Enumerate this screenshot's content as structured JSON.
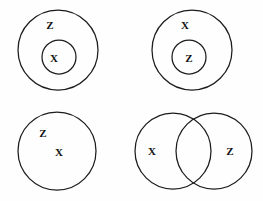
{
  "figure": {
    "title": "",
    "background_color": "#fefefe",
    "stroke_color": "#1c1c1c",
    "label_color": "#111111",
    "panels": [
      {
        "name": "top-left",
        "description": "X nested inside Z",
        "circles": [
          {
            "name": "outer-circle",
            "cx": 58,
            "cy": 50,
            "r": 40
          },
          {
            "name": "inner-circle",
            "cx": 59,
            "cy": 57,
            "r": 17
          }
        ],
        "labels": [
          {
            "name": "label-z-outer",
            "text": "Z",
            "x": 50,
            "y": 25
          },
          {
            "name": "label-x-inner",
            "text": "X",
            "x": 54,
            "y": 58
          }
        ]
      },
      {
        "name": "top-right",
        "description": "Z nested inside X",
        "circles": [
          {
            "name": "outer-circle",
            "cx": 192,
            "cy": 50,
            "r": 40
          },
          {
            "name": "inner-circle",
            "cx": 189,
            "cy": 57,
            "r": 17
          }
        ],
        "labels": [
          {
            "name": "label-x-outer",
            "text": "X",
            "x": 185,
            "y": 25
          },
          {
            "name": "label-z-inner",
            "text": "Z",
            "x": 189,
            "y": 58
          }
        ]
      },
      {
        "name": "bottom-left",
        "description": "X and Z in one circle",
        "circles": [
          {
            "name": "single-circle",
            "cx": 57,
            "cy": 151,
            "r": 39
          }
        ],
        "labels": [
          {
            "name": "label-z",
            "text": "Z",
            "x": 43,
            "y": 133
          },
          {
            "name": "label-x",
            "text": "X",
            "x": 59,
            "y": 152
          }
        ]
      },
      {
        "name": "bottom-right",
        "description": "X and Z overlapping",
        "circles": [
          {
            "name": "left-circle",
            "cx": 173,
            "cy": 151,
            "r": 38
          },
          {
            "name": "right-circle",
            "cx": 214,
            "cy": 151,
            "r": 38
          }
        ],
        "labels": [
          {
            "name": "label-x-left",
            "text": "X",
            "x": 152,
            "y": 151
          },
          {
            "name": "label-z-right",
            "text": "Z",
            "x": 230,
            "y": 151
          }
        ]
      }
    ]
  }
}
